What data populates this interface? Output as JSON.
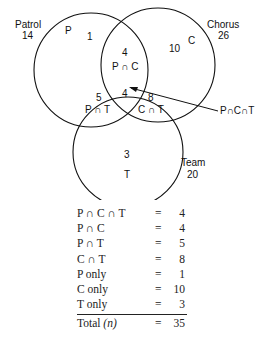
{
  "venn": {
    "sets": [
      {
        "name": "Patrol",
        "total": "14",
        "letter": "P"
      },
      {
        "name": "Chorus",
        "total": "26",
        "letter": "C"
      },
      {
        "name": "Team",
        "total": "20",
        "letter": "T"
      }
    ],
    "regions": {
      "p_only": {
        "value": "1"
      },
      "c_only": {
        "value": "10"
      },
      "t_only": {
        "value": "3"
      },
      "p_and_c": {
        "value": "4",
        "label": "P ∩ C"
      },
      "p_and_t": {
        "value": "5",
        "label": "P ∩ T"
      },
      "c_and_t": {
        "value": "8",
        "label": "C ∩ T"
      },
      "p_c_t": {
        "value": "4"
      }
    },
    "callout_label": "P∩C∩T"
  },
  "summary": {
    "rows": [
      {
        "key": "P ∩ C ∩ T",
        "eq": "=",
        "value": "4"
      },
      {
        "key": "P ∩ C",
        "eq": "=",
        "value": "4"
      },
      {
        "key": "P ∩ T",
        "eq": "=",
        "value": "5"
      },
      {
        "key": "C ∩ T",
        "eq": "=",
        "value": "8"
      },
      {
        "key": "P only",
        "eq": "=",
        "value": "1"
      },
      {
        "key": "C only",
        "eq": "=",
        "value": "10"
      },
      {
        "key": "T only",
        "eq": "=",
        "value": "3"
      }
    ],
    "total": {
      "key": "Total",
      "var": "(n)",
      "eq": "=",
      "value": "35"
    }
  }
}
